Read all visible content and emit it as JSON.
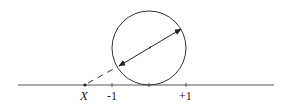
{
  "diagram": {
    "labels": {
      "point": "X",
      "minus_one": "-1",
      "plus_one": "+1"
    },
    "colors": {
      "stroke": "#333333",
      "axis": "#555555"
    }
  }
}
